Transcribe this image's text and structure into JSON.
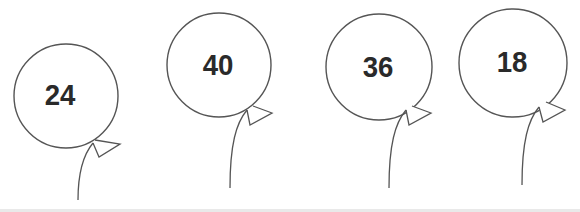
{
  "header": {
    "partial_text": "... y ... y ..."
  },
  "balloons": [
    {
      "label": "24",
      "cx": 66,
      "cy": 96,
      "r": 53
    },
    {
      "label": "40",
      "cx": 219,
      "cy": 65,
      "r": 52
    },
    {
      "label": "36",
      "cx": 379,
      "cy": 67,
      "r": 53
    },
    {
      "label": "18",
      "cx": 513,
      "cy": 63,
      "r": 53
    }
  ],
  "colors": {
    "outline": "#555555",
    "text": "#2a2a2a",
    "background": "#ffffff"
  }
}
